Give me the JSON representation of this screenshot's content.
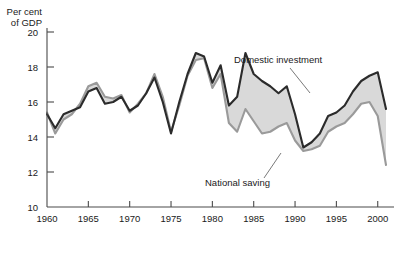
{
  "chart_data": {
    "type": "area",
    "title": "",
    "subtitle": "",
    "xlabel": "",
    "ylabel": "Per cent of GDP",
    "ylabel_line1": "Per cent",
    "ylabel_line2": "of GDP",
    "grid": false,
    "legend_position": "inline-annotations",
    "xlim": [
      1960,
      2001
    ],
    "ylim": [
      10,
      20
    ],
    "yticks": [
      10,
      12,
      14,
      16,
      18,
      20
    ],
    "ytick_labels": [
      "10",
      "12",
      "14",
      "16",
      "18",
      "20"
    ],
    "xticks": [
      1960,
      1965,
      1970,
      1975,
      1980,
      1985,
      1990,
      1995,
      2000
    ],
    "xtick_labels": [
      "1960",
      "1965",
      "1970",
      "1975",
      "1980",
      "1985",
      "1990",
      "1995",
      "2000"
    ],
    "x": [
      1960,
      1961,
      1962,
      1963,
      1964,
      1965,
      1966,
      1967,
      1968,
      1969,
      1970,
      1971,
      1972,
      1973,
      1974,
      1975,
      1976,
      1977,
      1978,
      1979,
      1980,
      1981,
      1982,
      1983,
      1984,
      1985,
      1986,
      1987,
      1988,
      1989,
      1990,
      1991,
      1992,
      1993,
      1994,
      1995,
      1996,
      1997,
      1998,
      1999,
      2000,
      2001
    ],
    "series": [
      {
        "name": "Domestic investment",
        "color": "#2b2b2b",
        "values": [
          15.3,
          14.5,
          15.3,
          15.5,
          15.7,
          16.6,
          16.8,
          15.9,
          16.0,
          16.3,
          15.5,
          15.8,
          16.5,
          17.4,
          16.0,
          14.2,
          16.0,
          17.6,
          18.8,
          18.6,
          17.1,
          18.1,
          15.8,
          16.3,
          18.8,
          17.6,
          17.2,
          16.9,
          16.5,
          16.9,
          15.3,
          13.4,
          13.7,
          14.2,
          15.2,
          15.4,
          15.8,
          16.6,
          17.2,
          17.5,
          17.7,
          15.6
        ]
      },
      {
        "name": "National saving",
        "color": "#9a9a9a",
        "values": [
          15.4,
          14.2,
          15.0,
          15.3,
          15.9,
          16.9,
          17.1,
          16.3,
          16.2,
          16.4,
          15.4,
          15.9,
          16.5,
          17.6,
          16.3,
          14.3,
          15.8,
          17.5,
          18.4,
          18.5,
          16.8,
          17.6,
          14.8,
          14.3,
          15.6,
          14.9,
          14.2,
          14.3,
          14.6,
          14.8,
          13.8,
          13.2,
          13.3,
          13.5,
          14.3,
          14.6,
          14.8,
          15.3,
          15.9,
          16.0,
          15.2,
          12.4
        ]
      }
    ],
    "annotations": [
      {
        "text": "Domestic investment",
        "x": 1984.5,
        "y": 19.6
      },
      {
        "text": "National saving",
        "x": 1983.5,
        "y": 11.4
      }
    ]
  }
}
